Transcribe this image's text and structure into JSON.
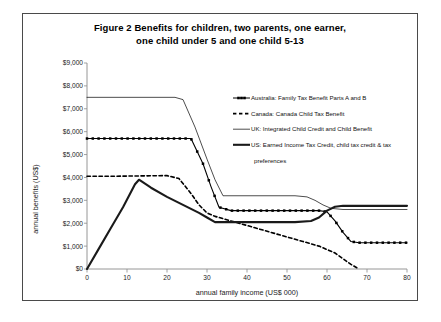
{
  "figure": {
    "title_line1": "Figure 2   Benefits for children, two parents, one earner,",
    "title_line2": "one child under 5 and one child 5-13"
  },
  "chart_data": {
    "type": "line",
    "title": "Figure 2 Benefits for children, two parents, one earner, one child under 5 and one child 5-13",
    "xlabel": "annual family income (US$ 000)",
    "ylabel": "annual benefits (US$)",
    "xlim": [
      0,
      80
    ],
    "ylim": [
      0,
      9000
    ],
    "xticks": [
      0,
      10,
      20,
      30,
      40,
      50,
      60,
      70,
      80
    ],
    "xtick_labels": [
      "0",
      "10",
      "20",
      "30",
      "40",
      "50",
      "60",
      "70",
      "80"
    ],
    "yticks": [
      0,
      1000,
      2000,
      3000,
      4000,
      5000,
      6000,
      7000,
      8000,
      9000
    ],
    "ytick_labels": [
      "$0",
      "$1,000",
      "$2,000",
      "$3,000",
      "$4,000",
      "$5,000",
      "$6,000",
      "$7,000",
      "$8,000",
      "$9,000"
    ],
    "grid": false,
    "legend_position": "upper right",
    "series": [
      {
        "name": "Australia: Family Tax Benefit Parts A and B",
        "style": "line-with-square-markers",
        "color": "#000000",
        "width": 1.1,
        "x": [
          0,
          4,
          8,
          12,
          16,
          20,
          23,
          26,
          29,
          31,
          33,
          36,
          40,
          44,
          48,
          52,
          56,
          58,
          60,
          62,
          64,
          66,
          68,
          72,
          76,
          80
        ],
        "y": [
          5700,
          5700,
          5700,
          5700,
          5700,
          5700,
          5700,
          5700,
          4600,
          3600,
          2700,
          2550,
          2550,
          2550,
          2550,
          2550,
          2550,
          2550,
          2500,
          2100,
          1600,
          1200,
          1150,
          1150,
          1150,
          1150
        ]
      },
      {
        "name": "Canada: Canada Child Tax Benefit",
        "style": "dashed",
        "color": "#000000",
        "width": 1.6,
        "x": [
          0,
          5,
          10,
          15,
          20,
          23,
          26,
          28,
          30,
          32,
          34,
          38,
          42,
          46,
          50,
          54,
          58,
          62,
          66,
          68
        ],
        "y": [
          4050,
          4050,
          4060,
          4070,
          4080,
          3950,
          3300,
          2800,
          2450,
          2300,
          2200,
          2000,
          1800,
          1600,
          1400,
          1200,
          1000,
          700,
          200,
          0
        ]
      },
      {
        "name": "UK: Integrated Child Credit and Child Benefit",
        "style": "thin-solid",
        "color": "#000000",
        "width": 0.7,
        "x": [
          0,
          8,
          16,
          22,
          24,
          27,
          30,
          32,
          34,
          40,
          46,
          52,
          55,
          57,
          59,
          61,
          64,
          70,
          76,
          80
        ],
        "y": [
          7500,
          7500,
          7500,
          7500,
          7400,
          6200,
          4800,
          3900,
          3200,
          3200,
          3200,
          3200,
          3150,
          3000,
          2800,
          2650,
          2600,
          2600,
          2600,
          2600
        ]
      },
      {
        "name": "US: Earned Income Tax Credit, child tax credit & tax preferences",
        "style": "thick-solid",
        "color": "#1a1a1a",
        "width": 2.1,
        "x": [
          0,
          3,
          6,
          9,
          12,
          13,
          16,
          20,
          24,
          28,
          30,
          32,
          33,
          36,
          40,
          46,
          52,
          56,
          58,
          60,
          62,
          64,
          68,
          72,
          76,
          80
        ],
        "y": [
          0,
          900,
          1800,
          2700,
          3700,
          3900,
          3550,
          3150,
          2800,
          2450,
          2250,
          2050,
          2050,
          2050,
          2050,
          2050,
          2050,
          2100,
          2250,
          2550,
          2720,
          2760,
          2760,
          2760,
          2760,
          2760
        ]
      }
    ]
  },
  "legend": {
    "items": [
      {
        "label": "Australia: Family Tax Benefit Parts A and B",
        "marker": "line-with-square-markers"
      },
      {
        "label": "Canada: Canada Child Tax Benefit",
        "marker": "dashed"
      },
      {
        "label": "UK: Integrated Child Credit and Child Benefit",
        "marker": "thin-solid"
      },
      {
        "label": "US: Earned Income Tax Credit, child tax credit & tax",
        "marker": "thick-solid"
      },
      {
        "label": "preferences",
        "marker": "none"
      }
    ]
  }
}
